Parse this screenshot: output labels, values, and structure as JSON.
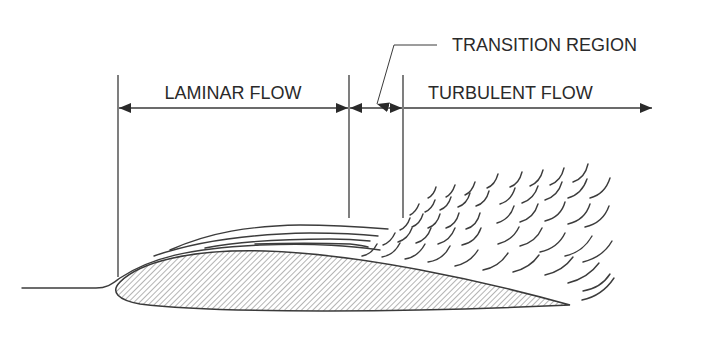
{
  "diagram": {
    "type": "airfoil boundary layer flow regimes",
    "labels": {
      "laminar": "LAMINAR FLOW",
      "transition": "TRANSITION REGION",
      "turbulent": "TURBULENT FLOW"
    },
    "colors": {
      "ink": "#3a3a3a",
      "hatch": "#6a6a6a",
      "background": "#ffffff"
    }
  }
}
